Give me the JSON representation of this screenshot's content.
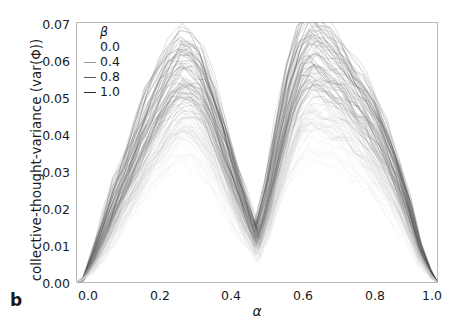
{
  "panel": {
    "letter": "b"
  },
  "axes": {
    "xlabel": "α",
    "ylabel": "collective-thought-variance (var(Φ))",
    "xticks": [
      "0.0",
      "0.2",
      "0.4",
      "0.6",
      "0.8",
      "1.0"
    ],
    "yticks": [
      "0.00",
      "0.01",
      "0.02",
      "0.03",
      "0.04",
      "0.05",
      "0.06",
      "0.07"
    ]
  },
  "legend": {
    "title": "β",
    "entries": [
      {
        "label": "0.0",
        "color": "#d8d8d8",
        "swatch": false
      },
      {
        "label": "0.4",
        "color": "#9a9a9a",
        "swatch": true
      },
      {
        "label": "0.8",
        "color": "#5a5a5a",
        "swatch": true
      },
      {
        "label": "1.0",
        "color": "#2a2a2a",
        "swatch": true
      }
    ]
  },
  "chart_data": {
    "type": "line",
    "title": "",
    "xlabel": "α",
    "ylabel": "collective-thought-variance (var(Φ))",
    "xlim": [
      0.0,
      1.0
    ],
    "ylim": [
      0.0,
      0.07
    ],
    "grid": false,
    "legend_position": "upper-left",
    "legend_title": "β",
    "x": [
      0.0,
      0.02,
      0.05,
      0.08,
      0.11,
      0.14,
      0.17,
      0.2,
      0.23,
      0.26,
      0.29,
      0.32,
      0.35,
      0.38,
      0.41,
      0.44,
      0.47,
      0.5,
      0.53,
      0.56,
      0.59,
      0.62,
      0.65,
      0.68,
      0.71,
      0.74,
      0.77,
      0.8,
      0.83,
      0.86,
      0.89,
      0.92,
      0.95,
      0.98,
      1.0
    ],
    "series": [
      {
        "name": "beta = 1.0",
        "color": "#2a2a2a",
        "values": [
          0.0,
          0.001,
          0.008,
          0.016,
          0.024,
          0.031,
          0.039,
          0.046,
          0.052,
          0.057,
          0.06,
          0.059,
          0.055,
          0.048,
          0.039,
          0.03,
          0.021,
          0.013,
          0.024,
          0.039,
          0.052,
          0.062,
          0.065,
          0.063,
          0.06,
          0.057,
          0.053,
          0.049,
          0.044,
          0.038,
          0.03,
          0.021,
          0.01,
          0.003,
          0.0
        ]
      },
      {
        "name": "beta = 0.8",
        "color": "#5a5a5a",
        "values": [
          0.0,
          0.001,
          0.007,
          0.014,
          0.021,
          0.028,
          0.035,
          0.042,
          0.048,
          0.053,
          0.057,
          0.056,
          0.052,
          0.045,
          0.036,
          0.027,
          0.019,
          0.012,
          0.022,
          0.036,
          0.048,
          0.057,
          0.061,
          0.06,
          0.057,
          0.054,
          0.05,
          0.046,
          0.041,
          0.035,
          0.028,
          0.019,
          0.009,
          0.003,
          0.0
        ]
      },
      {
        "name": "beta = 0.4",
        "color": "#9a9a9a",
        "values": [
          0.0,
          0.001,
          0.006,
          0.012,
          0.018,
          0.024,
          0.03,
          0.036,
          0.041,
          0.046,
          0.05,
          0.049,
          0.045,
          0.039,
          0.031,
          0.023,
          0.016,
          0.01,
          0.019,
          0.031,
          0.041,
          0.049,
          0.053,
          0.052,
          0.05,
          0.047,
          0.044,
          0.04,
          0.035,
          0.03,
          0.024,
          0.016,
          0.008,
          0.002,
          0.0
        ]
      },
      {
        "name": "beta = 0.0",
        "color": "#d8d8d8",
        "values": [
          0.0,
          0.001,
          0.004,
          0.009,
          0.014,
          0.019,
          0.024,
          0.029,
          0.033,
          0.037,
          0.04,
          0.039,
          0.036,
          0.031,
          0.025,
          0.019,
          0.013,
          0.008,
          0.015,
          0.025,
          0.033,
          0.039,
          0.042,
          0.041,
          0.04,
          0.038,
          0.035,
          0.032,
          0.028,
          0.024,
          0.019,
          0.013,
          0.006,
          0.002,
          0.0
        ]
      }
    ]
  }
}
